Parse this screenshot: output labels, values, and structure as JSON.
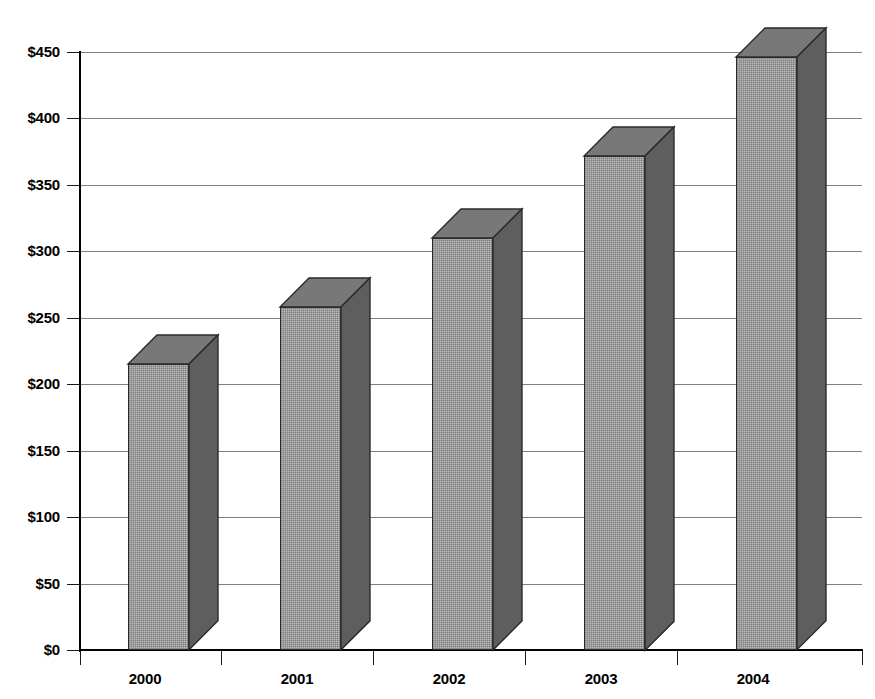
{
  "chart_data": {
    "type": "bar",
    "title": "",
    "subtitle": "",
    "xlabel": "",
    "ylabel": "",
    "categories": [
      "2000",
      "2001",
      "2002",
      "2003",
      "2004"
    ],
    "values": [
      215,
      258,
      310,
      372,
      446
    ],
    "series": [
      {
        "name": "Amount",
        "values": [
          215,
          258,
          310,
          372,
          446
        ]
      }
    ],
    "ylim": [
      0,
      450
    ],
    "ytick_values": [
      0,
      50,
      100,
      150,
      200,
      250,
      300,
      350,
      400,
      450
    ],
    "ytick_labels": [
      "$0",
      "$50",
      "$100",
      "$150",
      "$200",
      "$250",
      "$300",
      "$350",
      "$400",
      "$450"
    ],
    "xtick_labels": [
      "2000",
      "2001",
      "2002",
      "2003",
      "2004"
    ],
    "legend": [],
    "legend_position": "none",
    "grid": true,
    "grid_axis": "y",
    "annotations": [],
    "style": {
      "three_d": true,
      "bar_front_color": "#b8b8b8",
      "bar_side_color": "#5e5e5e",
      "bar_top_color": "#787878",
      "bar_outline_color": "#2b2b2b",
      "gridline_color": "#808080",
      "axis_color": "#000000",
      "background_color": "#ffffff",
      "text_color": "#000000"
    }
  }
}
